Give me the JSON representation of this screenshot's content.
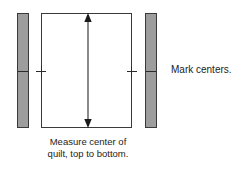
{
  "diagram": {
    "type": "instructional-line-drawing",
    "canvas": {
      "width": 251,
      "height": 169,
      "background": "#ffffff"
    },
    "colors": {
      "strip_fill": "#9d9d9d",
      "stroke": "#3a3a3a",
      "quilt_fill": "#ffffff",
      "text": "#1c1c1c",
      "arrow": "#2b2b2b"
    },
    "shapes": {
      "left_border_strip": {
        "name": "border strip",
        "x": 17,
        "y": 13,
        "width": 12,
        "height": 115,
        "fill": "#9d9d9d"
      },
      "right_border_strip": {
        "name": "border strip",
        "x": 145,
        "y": 13,
        "width": 12,
        "height": 115,
        "fill": "#9d9d9d"
      },
      "quilt_body": {
        "name": "quilt top",
        "x": 41,
        "y": 13,
        "width": 91,
        "height": 115,
        "fill": "#ffffff"
      }
    },
    "measure_arrow": {
      "name": "vertical double-headed measurement arrow",
      "orientation": "vertical",
      "double_headed": true,
      "x": 87,
      "y_top": 13,
      "y_bottom": 128
    },
    "center_marks": {
      "count": 4,
      "y": 71,
      "positions": [
        22,
        41,
        131,
        150
      ],
      "description": "small tick marks indicating centers of strips and quilt edges"
    }
  },
  "labels": {
    "mark_centers": "Mark centers.",
    "measure_line1": "Measure center of",
    "measure_line2": "quilt, top to bottom."
  }
}
